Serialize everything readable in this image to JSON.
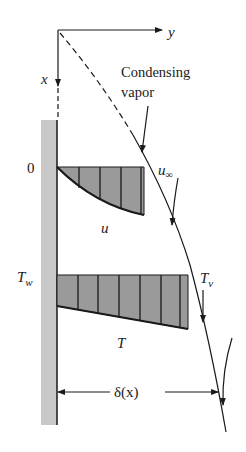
{
  "figure": {
    "colors": {
      "line": "#1a1a1a",
      "wall_fill": "#c8c8c8",
      "profile_fill": "#9a9a9a",
      "background": "#ffffff"
    }
  },
  "labels": {
    "x_axis": "x",
    "y_axis": "y",
    "condensing_line1": "Condensing",
    "condensing_line2": "vapor",
    "origin_zero": "0",
    "u_inf": "u",
    "u_inf_sub": "∞",
    "u_profile": "u",
    "T_wall": "T",
    "T_wall_sub": "w",
    "T_vapor": "T",
    "T_vapor_sub": "v",
    "T_profile": "T",
    "delta": "δ(x)"
  }
}
